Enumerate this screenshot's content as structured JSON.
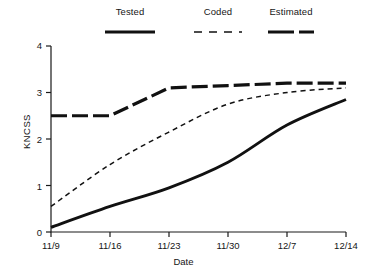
{
  "chart_data": {
    "type": "line",
    "title": "",
    "xlabel": "Date",
    "ylabel": "KNCSS",
    "x": [
      "11/9",
      "11/16",
      "11/23",
      "11/30",
      "12/7",
      "12/14"
    ],
    "xlim": [
      0,
      5
    ],
    "ylim": [
      0,
      4
    ],
    "yticks": [
      0,
      1,
      2,
      3,
      4
    ],
    "ytick_labels": [
      "0",
      "1",
      "2",
      "3",
      "4"
    ],
    "xtick_labels": [
      "11/9",
      "11/16",
      "11/23",
      "11/30",
      "12/7",
      "12/14"
    ],
    "grid": false,
    "legend_position": "top",
    "series": [
      {
        "name": "Tested",
        "style": "solid-thick",
        "color": "#111111",
        "values": [
          0.1,
          0.55,
          0.95,
          1.5,
          2.3,
          2.85
        ]
      },
      {
        "name": "Coded",
        "style": "dashed-thin",
        "color": "#111111",
        "values": [
          0.55,
          1.45,
          2.15,
          2.75,
          3.0,
          3.1
        ]
      },
      {
        "name": "Estimated",
        "style": "dash-dot-thick",
        "color": "#111111",
        "values": [
          2.5,
          2.5,
          3.1,
          3.15,
          3.2,
          3.2
        ]
      }
    ]
  },
  "legend": {
    "items": [
      {
        "label": "Tested",
        "key": "tested"
      },
      {
        "label": "Coded",
        "key": "coded"
      },
      {
        "label": "Estimated",
        "key": "estimated"
      }
    ]
  },
  "axes": {
    "y_title": "KNCSS",
    "x_title": "Date",
    "y_labels": [
      "4",
      "3",
      "2",
      "1",
      "0"
    ],
    "x_labels": [
      "11/9",
      "11/16",
      "11/23",
      "11/30",
      "12/7",
      "12/14"
    ]
  },
  "colors": {
    "ink": "#111111",
    "axis": "#1a1a1a",
    "background": "#ffffff"
  }
}
